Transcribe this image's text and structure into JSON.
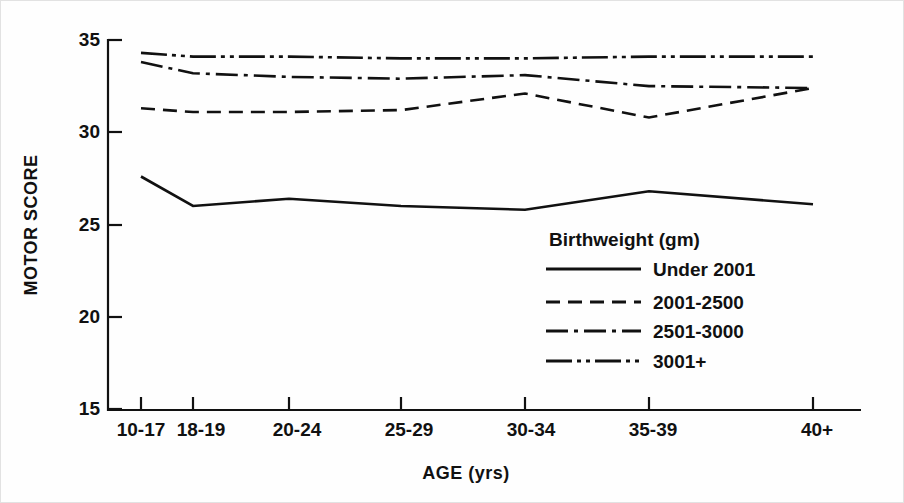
{
  "chart_data": {
    "type": "line",
    "title": "",
    "xlabel": "AGE (yrs)",
    "ylabel": "MOTOR SCORE",
    "categories": [
      "10-17",
      "18-19",
      "20-24",
      "25-29",
      "30-34",
      "35-39",
      "40+"
    ],
    "ylim": [
      15,
      35
    ],
    "yticks": [
      15,
      20,
      25,
      30,
      35
    ],
    "ytick_labels": [
      "15",
      "20",
      "25",
      "30",
      "35"
    ],
    "grid": false,
    "legend_position": "inside-right",
    "legend_title": "Birthweight (gm)",
    "series": [
      {
        "name": "Under 2001",
        "style": "solid",
        "dash": "none",
        "values": [
          27.6,
          26.0,
          26.4,
          26.0,
          25.8,
          26.8,
          26.1
        ]
      },
      {
        "name": "2001-2500",
        "style": "dashed",
        "dash": "14,8",
        "values": [
          31.3,
          31.1,
          31.1,
          31.2,
          32.1,
          30.8,
          32.4
        ]
      },
      {
        "name": "2501-3000",
        "style": "dash-dot",
        "dash": "22,6,4,6",
        "values": [
          33.8,
          33.2,
          33.0,
          32.9,
          33.1,
          32.5,
          32.4
        ]
      },
      {
        "name": "3001+",
        "style": "dash-dot-dot",
        "dash": "26,5,4,5,4,5",
        "values": [
          34.3,
          34.1,
          34.1,
          34.0,
          34.0,
          34.1,
          34.1
        ]
      }
    ],
    "colors": {
      "ink": "#111111",
      "background": "#ffffff"
    }
  }
}
